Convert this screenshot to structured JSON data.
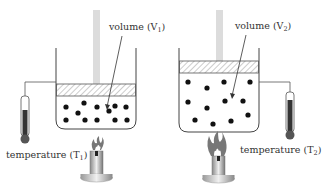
{
  "diagram": {
    "left_setup": {
      "volume_label": "volume (V",
      "volume_sub": "1",
      "temperature_label": "temperature (T",
      "temperature_sub": "1",
      "particle_count": 11,
      "flame_size": "small"
    },
    "right_setup": {
      "volume_label": "volume (V",
      "volume_sub": "2",
      "temperature_label": "temperature (T",
      "temperature_sub": "2",
      "particle_count": 11,
      "flame_size": "large"
    },
    "closing_paren": ")",
    "colors": {
      "line": "#333333",
      "piston_rod": "#d9d9d9",
      "hatch": "#888888",
      "particle": "#111111",
      "thermometer_fill": "#333333",
      "burner": "#aaaaaa"
    }
  }
}
